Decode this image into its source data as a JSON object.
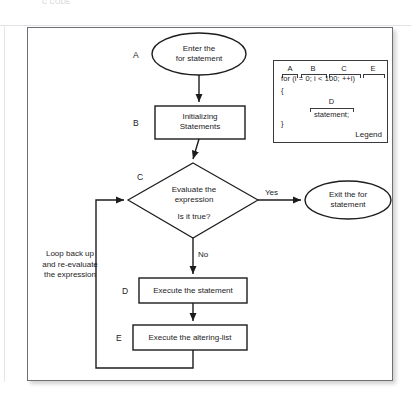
{
  "page": {
    "faded_caption": "C  CODE",
    "background_color": "#ffffff",
    "frame_border_color": "#6e6e73"
  },
  "flowchart": {
    "title": "For statement flowchart",
    "nodes": [
      {
        "id": "A",
        "letter": "A",
        "shape": "ellipse",
        "line1": "Enter the",
        "line2": "for statement"
      },
      {
        "id": "B",
        "letter": "B",
        "shape": "rectangle",
        "line1": "Initializing",
        "line2": "Statements"
      },
      {
        "id": "C",
        "letter": "C",
        "shape": "diamond",
        "line1": "Evaluate the",
        "line2": "expression",
        "line3": "Is it true?"
      },
      {
        "id": "EXIT",
        "letter": "",
        "shape": "ellipse",
        "line1": "Exit the for",
        "line2": "statement"
      },
      {
        "id": "D",
        "letter": "D",
        "shape": "rectangle",
        "line1": "Execute the statement"
      },
      {
        "id": "E",
        "letter": "E",
        "shape": "rectangle",
        "line1": "Execute the altering-list"
      }
    ],
    "edge_labels": {
      "yes": "Yes",
      "no": "No"
    },
    "loop_note": {
      "line1": "Loop back up",
      "line2": "and re-evaluate",
      "line3": "the expression"
    }
  },
  "legend": {
    "title": "Legend",
    "code_line": "for (i = 0;  i < 100;  ++i)",
    "brace_open": "{",
    "brace_close": "}",
    "body_letter": "D",
    "body_statement": "statement;",
    "marks": [
      {
        "letter": "A",
        "token": "for"
      },
      {
        "letter": "B",
        "token": "(i = 0;"
      },
      {
        "letter": "C",
        "token": "i < 100;"
      },
      {
        "letter": "E",
        "token": "++i)"
      }
    ]
  },
  "colors": {
    "stroke": "#1c1c1e",
    "frame": "#6e6e73",
    "text": "#1c1c1e",
    "faded": "#d2d2d6"
  }
}
